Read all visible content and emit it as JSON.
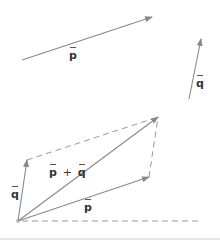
{
  "diagram": {
    "colors": {
      "arrow": "#888888",
      "dashed": "#999999",
      "label": "#333333"
    },
    "labels": {
      "p_top": "p",
      "q_top": "q",
      "q_left": "q",
      "p_bottom": "p",
      "sum_p": "p",
      "sum_plus": "+",
      "sum_q": "q"
    },
    "vectors": [
      {
        "name": "p",
        "from": [
          22,
          60
        ],
        "to": [
          152,
          17
        ]
      },
      {
        "name": "q",
        "from": [
          189,
          99
        ],
        "to": [
          201,
          39
        ]
      },
      {
        "name": "q",
        "from": [
          18,
          221
        ],
        "to": [
          27,
          160
        ]
      },
      {
        "name": "p",
        "from": [
          18,
          221
        ],
        "to": [
          149,
          177
        ]
      },
      {
        "name": "p+q",
        "from": [
          18,
          221
        ],
        "to": [
          158,
          117
        ]
      }
    ],
    "dashed_lines": [
      {
        "from": [
          27,
          160
        ],
        "to": [
          158,
          117
        ]
      },
      {
        "from": [
          149,
          177
        ],
        "to": [
          158,
          117
        ]
      },
      {
        "from": [
          22,
          221
        ],
        "to": [
          198,
          221
        ]
      }
    ]
  }
}
